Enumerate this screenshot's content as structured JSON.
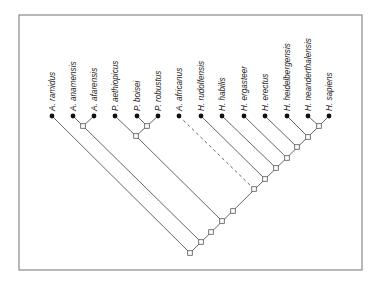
{
  "figure": {
    "type": "cladogram",
    "frame": {
      "x": 19,
      "y": 15,
      "width": 343,
      "height": 255,
      "stroke": "#8a8a8a"
    },
    "colors": {
      "line": "#555555",
      "leaf_dot": "#111111",
      "node_fill": "#ffffff",
      "node_stroke": "#555555",
      "text": "#222222"
    },
    "leaf_y": 116,
    "taxa": [
      {
        "id": "ramidus",
        "label": "A. ramidus",
        "x": 52
      },
      {
        "id": "anamensis",
        "label": "A. anamensis",
        "x": 73
      },
      {
        "id": "afarensis",
        "label": "A. afarensis",
        "x": 94
      },
      {
        "id": "aethiopicus",
        "label": "P. aethiopicus",
        "x": 115
      },
      {
        "id": "boisei",
        "label": "P. boisei",
        "x": 137
      },
      {
        "id": "robustus",
        "label": "P. robustus",
        "x": 158
      },
      {
        "id": "africanus",
        "label": "A. africanus",
        "x": 179
      },
      {
        "id": "rudolfensis",
        "label": "H. rudolfensis",
        "x": 201
      },
      {
        "id": "habilis",
        "label": "H. habilis",
        "x": 222
      },
      {
        "id": "ergaster",
        "label": "H. ergasteer",
        "x": 244
      },
      {
        "id": "erectus",
        "label": "H. erectus",
        "x": 265
      },
      {
        "id": "heidelbergensis",
        "label": "H. heidelbergensis",
        "x": 287
      },
      {
        "id": "neanderthalensis",
        "label": "H. neanderthalensis",
        "x": 308
      },
      {
        "id": "sapiens",
        "label": "H. sapiens",
        "x": 329
      }
    ],
    "internal_nodes": [
      {
        "id": "A-clade",
        "x": 83,
        "y": 126
      },
      {
        "id": "Pbr",
        "x": 147,
        "y": 126
      },
      {
        "id": "P-clade",
        "x": 136,
        "y": 136
      },
      {
        "id": "NS",
        "x": 319,
        "y": 126
      },
      {
        "id": "s0",
        "x": 190,
        "y": 253
      },
      {
        "id": "s1",
        "x": 201,
        "y": 242
      },
      {
        "id": "s2",
        "x": 211,
        "y": 232
      },
      {
        "id": "s3",
        "x": 222,
        "y": 221
      },
      {
        "id": "s4",
        "x": 233,
        "y": 211
      },
      {
        "id": "s5",
        "x": 254,
        "y": 189
      },
      {
        "id": "s6",
        "x": 265,
        "y": 179
      },
      {
        "id": "s7",
        "x": 276,
        "y": 168
      },
      {
        "id": "s8",
        "x": 287,
        "y": 158
      },
      {
        "id": "s9",
        "x": 297,
        "y": 147
      },
      {
        "id": "s10",
        "x": 308,
        "y": 137
      }
    ],
    "edges": [
      {
        "from": "ramidus",
        "to": "s0",
        "style": "solid"
      },
      {
        "from": "anamensis",
        "to": "A-clade",
        "style": "solid"
      },
      {
        "from": "afarensis",
        "to": "A-clade",
        "style": "solid"
      },
      {
        "from": "A-clade",
        "to": "s1",
        "style": "solid"
      },
      {
        "from": "boisei",
        "to": "Pbr",
        "style": "solid"
      },
      {
        "from": "robustus",
        "to": "Pbr",
        "style": "solid"
      },
      {
        "from": "aethiopicus",
        "to": "P-clade",
        "style": "solid"
      },
      {
        "from": "Pbr",
        "to": "P-clade",
        "style": "solid"
      },
      {
        "from": "P-clade",
        "to": "s3",
        "style": "solid"
      },
      {
        "from": "africanus",
        "to": "s5",
        "style": "dashed"
      },
      {
        "from": "rudolfensis",
        "to": "s6",
        "style": "solid"
      },
      {
        "from": "habilis",
        "to": "s7",
        "style": "solid"
      },
      {
        "from": "ergaster",
        "to": "s8",
        "style": "solid"
      },
      {
        "from": "erectus",
        "to": "s9",
        "style": "solid"
      },
      {
        "from": "heidelbergensis",
        "to": "s10",
        "style": "solid"
      },
      {
        "from": "neanderthalensis",
        "to": "NS",
        "style": "solid"
      },
      {
        "from": "sapiens",
        "to": "NS",
        "style": "solid"
      },
      {
        "from": "s0",
        "to": "NS",
        "style": "solid"
      }
    ]
  }
}
